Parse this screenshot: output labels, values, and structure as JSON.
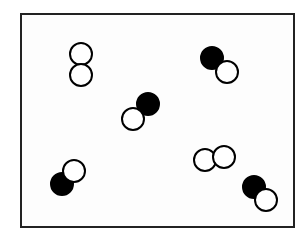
{
  "diagram": {
    "frame": {
      "x": 20,
      "y": 13,
      "width": 275,
      "height": 215,
      "stroke": "#222222"
    },
    "atom_radius": 11,
    "colors": {
      "dark_atom": "#000000",
      "light_atom": "#ffffff",
      "outline": "#000000"
    },
    "molecules": [
      {
        "id": "m1",
        "type": "light-light",
        "atoms": [
          {
            "x": 81,
            "y": 54,
            "fill": "light"
          },
          {
            "x": 81,
            "y": 75,
            "fill": "light"
          }
        ]
      },
      {
        "id": "m2",
        "type": "dark-light",
        "atoms": [
          {
            "x": 212,
            "y": 58,
            "fill": "dark"
          },
          {
            "x": 227,
            "y": 72,
            "fill": "light"
          }
        ]
      },
      {
        "id": "m3",
        "type": "dark-light",
        "atoms": [
          {
            "x": 148,
            "y": 104,
            "fill": "dark"
          },
          {
            "x": 133,
            "y": 119,
            "fill": "light"
          }
        ]
      },
      {
        "id": "m4",
        "type": "dark-light",
        "atoms": [
          {
            "x": 62,
            "y": 184,
            "fill": "dark"
          },
          {
            "x": 74,
            "y": 171,
            "fill": "light"
          }
        ]
      },
      {
        "id": "m5",
        "type": "light-light",
        "atoms": [
          {
            "x": 205,
            "y": 160,
            "fill": "light"
          },
          {
            "x": 224,
            "y": 157,
            "fill": "light"
          }
        ]
      },
      {
        "id": "m6",
        "type": "dark-light",
        "atoms": [
          {
            "x": 254,
            "y": 187,
            "fill": "dark"
          },
          {
            "x": 266,
            "y": 200,
            "fill": "light"
          }
        ]
      }
    ]
  }
}
